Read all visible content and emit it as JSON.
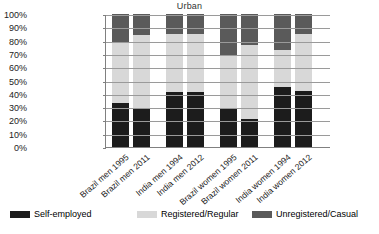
{
  "chart_data": {
    "type": "bar",
    "subtype": "stacked-100-percent",
    "title": "Urban",
    "xlabel": "",
    "ylabel": "",
    "ylim": [
      0,
      100
    ],
    "ytick_labels": [
      "100%",
      "90%",
      "80%",
      "70%",
      "60%",
      "50%",
      "40%",
      "30%",
      "20%",
      "10%",
      "0%"
    ],
    "ytick_values": [
      100,
      90,
      80,
      70,
      60,
      50,
      40,
      30,
      20,
      10,
      0
    ],
    "grid": true,
    "legend_position": "bottom",
    "categories": [
      "Brazil men 1995",
      "Brazil men 2011",
      "India men 1994",
      "India men 2012",
      "Brazil women 1995",
      "Brazil women 2011",
      "India women 1994",
      "India women 2012"
    ],
    "series": [
      {
        "name": "Self-employed",
        "color": "#1c1c1c",
        "values": [
          33,
          29,
          41,
          41,
          29,
          21,
          45,
          42
        ]
      },
      {
        "name": "Registered/Regular",
        "color": "#d8d8d8",
        "values": [
          46,
          55,
          44,
          44,
          40,
          56,
          28,
          43
        ]
      },
      {
        "name": "Unregistered/Casual",
        "color": "#5a5a5a",
        "values": [
          21,
          16,
          15,
          15,
          31,
          23,
          27,
          15
        ]
      }
    ]
  },
  "legend": {
    "items": [
      {
        "label": "Self-employed"
      },
      {
        "label": "Registered/Regular"
      },
      {
        "label": "Unregistered/Casual"
      }
    ]
  }
}
